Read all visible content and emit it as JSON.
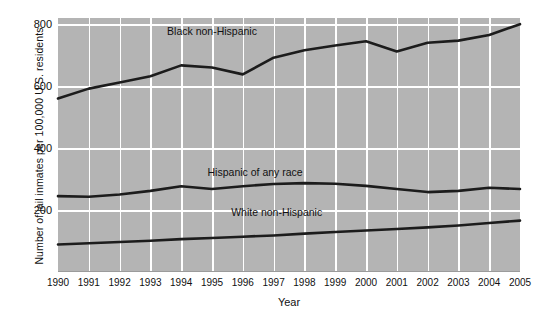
{
  "chart_data": {
    "type": "line",
    "title": "",
    "xlabel": "Year",
    "ylabel": "Number of jail inmates per 100,000 U.S. residents",
    "x": [
      1990,
      1991,
      1992,
      1993,
      1994,
      1995,
      1996,
      1997,
      1998,
      1999,
      2000,
      2001,
      2002,
      2003,
      2004,
      2005
    ],
    "xtick_labels": [
      "1990",
      "1991",
      "1992",
      "1993",
      "1994",
      "1995",
      "1996",
      "1997",
      "1998",
      "1999",
      "2000",
      "2001",
      "2002",
      "2003",
      "2004",
      "2005"
    ],
    "ytick_labels": [
      "200",
      "400",
      "600",
      "800"
    ],
    "yticks": [
      200,
      400,
      600,
      800
    ],
    "ylim": [
      0,
      820
    ],
    "xlim": [
      1990,
      2005
    ],
    "grid": true,
    "legend_position": "inline-annotations",
    "plot_background": "#b4b4b4",
    "line_color": "#1c1c1c",
    "gridline_color": "#ffffff",
    "series": [
      {
        "name": "Black non-Hispanic",
        "label": "Black non-Hispanic",
        "label_x": 1995.0,
        "label_y": 775,
        "values": [
          560,
          592,
          612,
          632,
          667,
          660,
          638,
          692,
          716,
          731,
          745,
          712,
          740,
          747,
          765,
          800
        ]
      },
      {
        "name": "Hispanic of any race",
        "label": "Hispanic of any race",
        "label_x": 1996.4,
        "label_y": 320,
        "values": [
          245,
          243,
          250,
          262,
          277,
          268,
          277,
          284,
          287,
          285,
          278,
          268,
          258,
          262,
          272,
          268
        ]
      },
      {
        "name": "White non-Hispanic",
        "label": "White non-Hispanic",
        "label_x": 1997.1,
        "label_y": 190,
        "values": [
          89,
          93,
          97,
          101,
          106,
          110,
          114,
          118,
          124,
          129,
          134,
          139,
          144,
          150,
          158,
          166
        ]
      }
    ]
  }
}
